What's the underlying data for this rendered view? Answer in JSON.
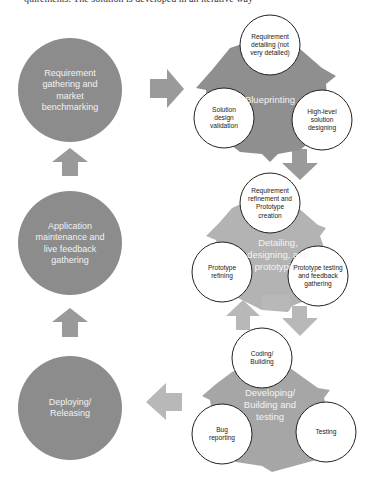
{
  "top_clip_text": "quirements. The solution is developed in an iterative way",
  "phases": {
    "requirement": "Requirement gathering and market benchmarking",
    "maintenance": "Application maintenance and live feedback gathering",
    "deploying": "Deploying/ Releasing"
  },
  "cycles": {
    "blueprinting": {
      "hub": "Blueprinting",
      "steps": [
        "Requirement detailing (not very detailed)",
        "High-level solution designing",
        "Solution design validation"
      ]
    },
    "detailing": {
      "hub": "Detailing, designing, and prototyping",
      "steps": [
        "Requirement refinement and Prototype creation",
        "Prototype testing and feedback gathering",
        "Prototype refining"
      ]
    },
    "developing": {
      "hub": "Developing/ Building and testing",
      "steps": [
        "Coding/ Building",
        "Testing",
        "Bug reporting"
      ]
    }
  },
  "colors": {
    "dark_gray": "#8c8c8c",
    "blueprint_gray": "#8f8f8f",
    "detail_gray": "#b3b3b3",
    "develop_gray": "#a6a6a6",
    "arrow_gray": "#9a9a9a",
    "light_arrow": "#b8b8b8"
  }
}
